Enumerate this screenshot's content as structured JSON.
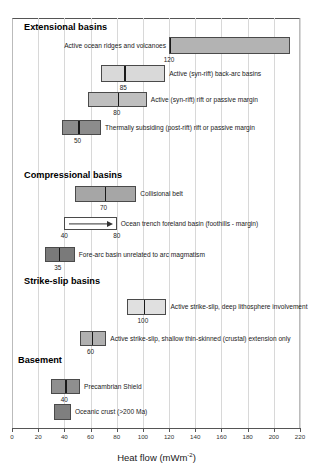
{
  "chart_data": {
    "type": "bar",
    "orientation": "horizontal",
    "title": "",
    "xlabel": "Heat flow (mWm-2)",
    "xlabel_text": "Heat flow (mWm",
    "xlabel_sup": "-2",
    "xlabel_tail": ")",
    "ylabel": "",
    "xlim": [
      0,
      220
    ],
    "xticks": [
      0,
      20,
      40,
      60,
      80,
      100,
      120,
      140,
      160,
      180,
      200,
      220
    ],
    "grid": "vertical-light",
    "legend": "none",
    "note": "Ranges of heat flow for tectonic settings; vertical tick inside each bar marks the typical/characteristic value, which is printed below the bar.",
    "groups": [
      {
        "name": "Extensional basins",
        "items": [
          {
            "label": "Active ocean ridges and volcanoes",
            "range": [
              120,
              212
            ],
            "marker": 120,
            "marker_label": "120",
            "marker_position": "start",
            "fill": "#b3b3b3",
            "label_side": "left",
            "style": "box"
          },
          {
            "label": "Active (syn-rift) back-arc basins",
            "range": [
              68,
              117
            ],
            "marker": 85,
            "marker_label": "85",
            "marker_position": "inside",
            "fill": "#d9d9d9",
            "label_side": "right",
            "style": "box"
          },
          {
            "label": "Active (syn-rift) rift or passive margin",
            "range": [
              58,
              103
            ],
            "marker": 80,
            "marker_label": "80",
            "marker_position": "inside",
            "fill": "#bfbfbf",
            "label_side": "right",
            "style": "box"
          },
          {
            "label": "Thermally subsiding (post-rift) rift or passive margin",
            "range": [
              38,
              68
            ],
            "marker": 50,
            "marker_label": "50",
            "marker_position": "inside",
            "fill": "#8c8c8c",
            "label_side": "right",
            "style": "box"
          }
        ]
      },
      {
        "name": "Compressional basins",
        "items": [
          {
            "label": "Collisional belt",
            "range": [
              48,
              95
            ],
            "marker": 70,
            "marker_label": "70",
            "marker_position": "inside",
            "fill": "#a6a6a6",
            "label_side": "right",
            "style": "box"
          },
          {
            "label": "Ocean trench foreland basin (foothills - margin)",
            "range": [
              40,
              80
            ],
            "marker": null,
            "marker_label": "40",
            "marker_label_2": "80",
            "marker_position": "ends",
            "fill": "#ffffff",
            "label_side": "right",
            "style": "arrow"
          },
          {
            "label": "Fore-arc basin unrelated to arc magmatism",
            "range": [
              25,
              48
            ],
            "marker": 35,
            "marker_label": "35",
            "marker_position": "inside",
            "fill": "#7a7a7a",
            "label_side": "right",
            "style": "box"
          }
        ]
      },
      {
        "name": "Strike-slip basins",
        "items": [
          {
            "label": "Active strike-slip, deep lithosphere involvement",
            "range": [
              88,
              118
            ],
            "marker": 100,
            "marker_label": "100",
            "marker_position": "inside",
            "fill": "#e0e0e0",
            "label_side": "right",
            "style": "box"
          },
          {
            "label": "Active strike-slip, shallow thin-skinned (crustal) extension only",
            "range": [
              52,
              72
            ],
            "marker": 60,
            "marker_label": "60",
            "marker_position": "inside",
            "fill": "#b0b0b0",
            "label_side": "right",
            "style": "box"
          }
        ]
      },
      {
        "name": "Basement",
        "items": [
          {
            "label": "Precambrian Shield",
            "range": [
              30,
              52
            ],
            "marker": 40,
            "marker_label": "40",
            "marker_position": "inside",
            "fill": "#8f8f8f",
            "label_side": "right",
            "style": "box"
          },
          {
            "label": "Oceanic crust (>200 Ma)",
            "range": [
              32,
              45
            ],
            "marker": null,
            "marker_label": "",
            "marker_position": "none",
            "fill": "#7f7f7f",
            "label_side": "right",
            "style": "box"
          }
        ]
      }
    ]
  },
  "geometry": {
    "plot_left_px": 12,
    "plot_right_px": 300,
    "x_min": 0,
    "x_max": 220,
    "group_heading_y": [
      22,
      170,
      276,
      355
    ],
    "group_heading_x": [
      24,
      24,
      24,
      18
    ],
    "bar_rows": [
      {
        "y": 37,
        "h": 17
      },
      {
        "y": 65,
        "h": 17
      },
      {
        "y": 92,
        "h": 15
      },
      {
        "y": 120,
        "h": 15
      },
      {
        "y": 186,
        "h": 16
      },
      {
        "y": 217,
        "h": 13
      },
      {
        "y": 247,
        "h": 15
      },
      {
        "y": 299,
        "h": 16
      },
      {
        "y": 331,
        "h": 15
      },
      {
        "y": 379,
        "h": 15
      },
      {
        "y": 404,
        "h": 16
      }
    ]
  }
}
